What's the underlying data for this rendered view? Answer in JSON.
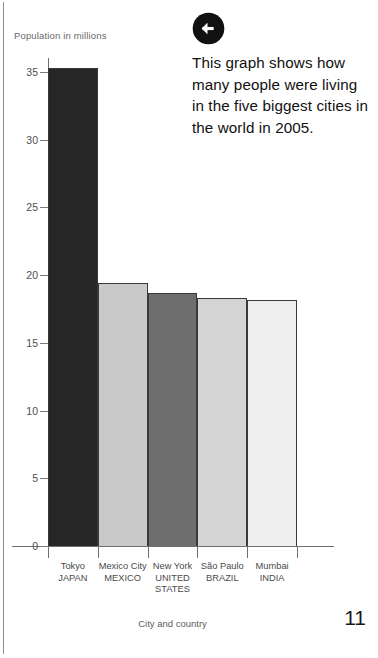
{
  "page": {
    "number": "11",
    "back_icon": "back-arrow-icon"
  },
  "info_panel": {
    "body": "This graph shows how many people were living in the five biggest cities in the world in 2005."
  },
  "chart_data": {
    "type": "bar",
    "title": "Population in millions",
    "xlabel": "City and country",
    "ylabel": "Population in millions",
    "ylim": [
      0,
      35
    ],
    "ytick_labels": [
      "0",
      "5",
      "10",
      "15",
      "20",
      "25",
      "30",
      "35"
    ],
    "ytick_values": [
      0,
      5,
      10,
      15,
      20,
      25,
      30,
      35
    ],
    "grid": false,
    "legend": "none",
    "categories": [
      "Tokyo JAPAN",
      "Mexico City MEXICO",
      "New York UNITED STATES",
      "São Paulo BRAZIL",
      "Mumbai INDIA"
    ],
    "values": [
      35.3,
      19.4,
      18.7,
      18.3,
      18.2
    ],
    "bars": [
      {
        "city": "Tokyo",
        "country": "JAPAN",
        "value": 35.3,
        "color": "#262626"
      },
      {
        "city": "Mexico City",
        "country": "MEXICO",
        "value": 19.4,
        "color": "#c9c9c9"
      },
      {
        "city": "New York",
        "country": "UNITED STATES",
        "value": 18.7,
        "color": "#6e6e6e"
      },
      {
        "city": "São Paulo",
        "country": "BRAZIL",
        "value": 18.3,
        "color": "#d4d4d4"
      },
      {
        "city": "Mumbai",
        "country": "INDIA",
        "value": 18.2,
        "color": "#efefef"
      }
    ]
  }
}
